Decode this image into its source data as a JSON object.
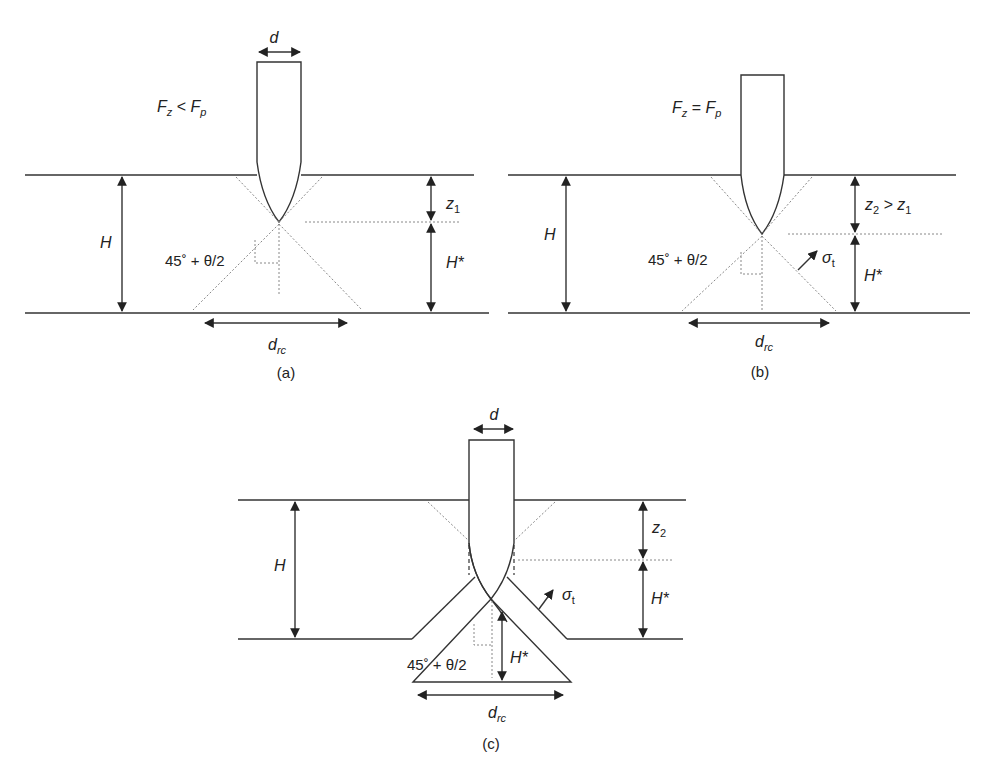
{
  "figure": {
    "panels": [
      {
        "id": "a",
        "caption": "(a)",
        "condition": {
          "lhs": "F",
          "lhs_sub": "z",
          "op": " < ",
          "rhs": "F",
          "rhs_sub": "p"
        },
        "probe_width_label": "d",
        "thickness_label": "H",
        "penetration_label": {
          "main": "z",
          "sub": "1",
          "suffix": "",
          "suffix_sub": ""
        },
        "remaining_label": "H*",
        "angle_label": "45˚ + θ/2",
        "base_label": {
          "main": "d",
          "sub": "rc"
        }
      },
      {
        "id": "b",
        "caption": "(b)",
        "condition": {
          "lhs": "F",
          "lhs_sub": "z",
          "op": " = ",
          "rhs": "F",
          "rhs_sub": "p"
        },
        "thickness_label": "H",
        "penetration_label": {
          "main": "z",
          "sub": "2",
          "suffix": " > z",
          "suffix_sub": "1"
        },
        "remaining_label": "H*",
        "angle_label": "45˚ + θ/2",
        "stress_label": {
          "main": "σ",
          "sub": "t"
        },
        "base_label": {
          "main": "d",
          "sub": "rc"
        }
      },
      {
        "id": "c",
        "caption": "(c)",
        "probe_width_label": "d",
        "thickness_label": "H",
        "penetration_label": {
          "main": "z",
          "sub": "2"
        },
        "remaining_label": "H*",
        "plug_height_label": "H*",
        "angle_label": "45˚ + θ/2",
        "stress_label": {
          "main": "σ",
          "sub": "t"
        },
        "base_label": {
          "main": "d",
          "sub": "rc"
        }
      }
    ]
  }
}
